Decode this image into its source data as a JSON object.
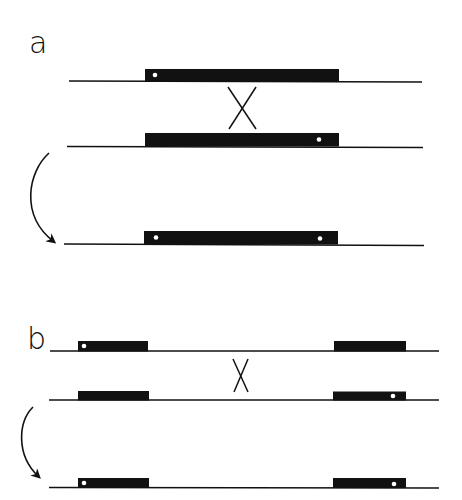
{
  "panels": [
    {
      "label": "a",
      "description": "Recombination between two inverted-repeat copies on the same molecule",
      "strands": [
        {
          "role": "upper-strand",
          "markers": [
            "left"
          ]
        },
        {
          "role": "lower-strand",
          "markers": [
            "right"
          ]
        },
        {
          "role": "product-strand",
          "markers": [
            "left",
            "right"
          ]
        }
      ],
      "crossover_symbol": "X"
    },
    {
      "label": "b",
      "description": "Recombination between two separated repeat copies",
      "strands": [
        {
          "role": "upper-strand",
          "markers": [
            "left-block-left"
          ]
        },
        {
          "role": "lower-strand",
          "markers": [
            "right-block-right"
          ]
        },
        {
          "role": "product-strand",
          "markers": [
            "left-block-left",
            "right-block-right"
          ]
        }
      ],
      "crossover_symbol": "X"
    }
  ],
  "colors": {
    "ink": "#111111",
    "background": "#ffffff",
    "marker": "#ffffff"
  }
}
